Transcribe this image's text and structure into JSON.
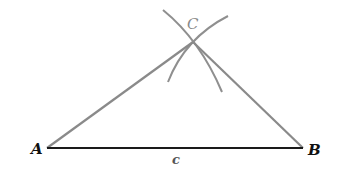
{
  "diagram": {
    "type": "geometric-construction",
    "points": {
      "A": {
        "label": "A",
        "x": 47,
        "y": 148
      },
      "B": {
        "label": "B",
        "x": 303,
        "y": 148
      },
      "C": {
        "label": "C",
        "x": 193,
        "y": 42
      }
    },
    "segments": [
      {
        "from": "A",
        "to": "B",
        "label": "c",
        "color": "#1a1a1a"
      },
      {
        "from": "A",
        "to": "C",
        "label": "",
        "color": "#8a8a8a"
      },
      {
        "from": "C",
        "to": "B",
        "label": "",
        "color": "#8a8a8a"
      }
    ],
    "labels": {
      "A": "A",
      "B": "B",
      "C": "C",
      "c": "c"
    },
    "colors": {
      "base_line": "#1a1a1a",
      "construction_lines": "#8a8a8a",
      "label_text": "#111111",
      "c_label": "#888888"
    }
  }
}
